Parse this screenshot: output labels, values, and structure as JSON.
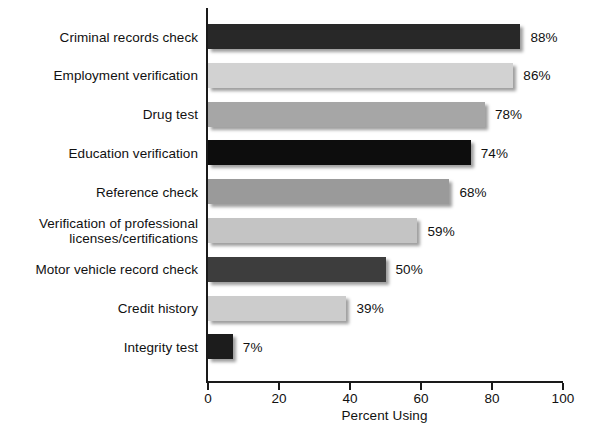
{
  "chart_data": {
    "type": "bar",
    "orientation": "horizontal",
    "title": "",
    "xlabel": "Percent Using",
    "ylabel": "",
    "xlim": [
      0,
      100
    ],
    "xticks": [
      0,
      20,
      40,
      60,
      80,
      100
    ],
    "xtick_labels": [
      "0",
      "20",
      "40",
      "60",
      "80",
      "100"
    ],
    "grid": false,
    "legend": null,
    "categories": [
      "Criminal records check",
      "Employment verification",
      "Drug test",
      "Education verification",
      "Reference check",
      "Verification of professional\nlicenses/certifications",
      "Motor vehicle record check",
      "Credit history",
      "Integrity test"
    ],
    "values": [
      88,
      86,
      78,
      74,
      68,
      59,
      50,
      39,
      7
    ],
    "value_labels": [
      "88%",
      "86%",
      "78%",
      "74%",
      "68%",
      "59%",
      "50%",
      "39%",
      "7%"
    ],
    "bar_colors": [
      "#282828",
      "#d2d2d2",
      "#a6a6a6",
      "#0d0d0d",
      "#9a9a9a",
      "#c4c4c4",
      "#3d3d3d",
      "#cccccc",
      "#1c1c1c"
    ]
  },
  "axis": {
    "line_color": "#1a1a1a"
  }
}
